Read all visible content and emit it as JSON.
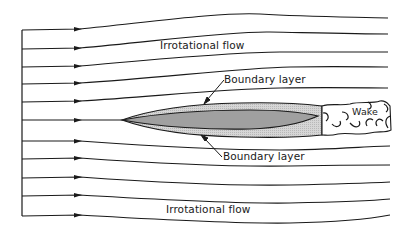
{
  "diagram": {
    "labels": {
      "irrotational_top": "Irrotational flow",
      "irrotational_bottom": "Irrotational flow",
      "boundary_layer_top": "Boundary layer",
      "boundary_layer_bottom": "Boundary layer",
      "wake": "Wake"
    },
    "streamlines": {
      "count": 11,
      "inlet_x": 22,
      "arrow_x": 80,
      "y_inlet": [
        30,
        49,
        67,
        84,
        102,
        120,
        141,
        159,
        178,
        196,
        216
      ]
    },
    "colors": {
      "line": "#1a1a1a",
      "body_fill": "#a0a0a0",
      "boundary_layer_fill": "#cfcfcf",
      "background": "#ffffff"
    }
  }
}
